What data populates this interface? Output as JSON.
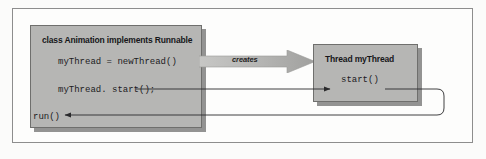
{
  "figure": {
    "background_color": "#fbfbfa",
    "frame_border_color": "#8d8d8d",
    "box_fill_color": "#b6b6b4",
    "box_border_color": "#6f6f6d",
    "line_color": "#2a2a2c",
    "arrow_fill_color": "#b0b0ae"
  },
  "class_box": {
    "title": "class Animation implements Runnable",
    "lines": [
      "myThread = newThread()",
      "myThread. start();",
      "run()"
    ]
  },
  "thread_box": {
    "title": "Thread myThread",
    "lines": [
      "start()"
    ]
  },
  "creates_arrow": {
    "label": "creates"
  },
  "connectors": [
    {
      "name": "start-call-to-start-def",
      "from": "myThread. start();",
      "to": "start()",
      "arrowhead": "right"
    },
    {
      "name": "start-def-to-run",
      "from": "start()",
      "to": "run()",
      "arrowhead": "left"
    }
  ]
}
